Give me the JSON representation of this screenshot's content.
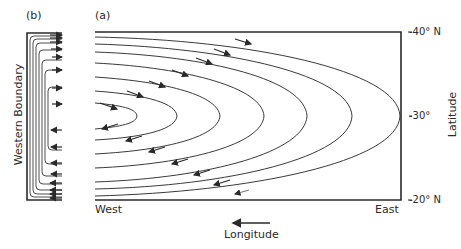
{
  "panels": {
    "b": {
      "label": "(b)",
      "axis_label": "Western Boundary"
    },
    "a": {
      "label": "(a)"
    }
  },
  "axes": {
    "x_left": "West",
    "x_right": "East",
    "x_title": "Longitude",
    "y_title": "Latitude",
    "y_ticks": [
      "-40° N",
      "-30°",
      "-20° N"
    ]
  },
  "colors": {
    "line": "#3a3a3a",
    "background": "#ffffff"
  },
  "diagram": {
    "streamline_count": 9,
    "flow_top": "eastward",
    "flow_bottom": "westward"
  }
}
